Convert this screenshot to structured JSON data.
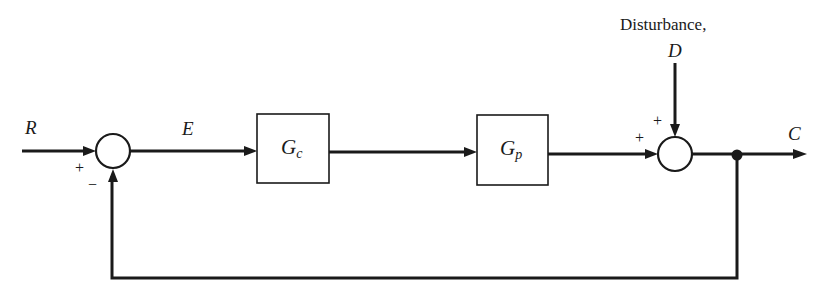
{
  "diagram": {
    "type": "feedback-control-block-diagram",
    "signals": {
      "reference": "R",
      "error": "E",
      "output": "C",
      "disturbance_caption": "Disturbance,",
      "disturbance": "D"
    },
    "blocks": [
      {
        "id": "controller",
        "main": "G",
        "sub": "c"
      },
      {
        "id": "process",
        "main": "G",
        "sub": "p"
      }
    ],
    "junctions": [
      {
        "id": "comparator",
        "signs": {
          "reference_input": "+",
          "feedback_input": "−"
        }
      },
      {
        "id": "disturbance-sum",
        "signs": {
          "process_input": "+",
          "disturbance_input": "+"
        }
      }
    ],
    "colors": {
      "line": "#1a1a1a",
      "background": "#ffffff"
    }
  }
}
